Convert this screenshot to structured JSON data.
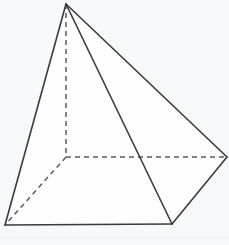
{
  "figure": {
    "name": "square-based-pyramid",
    "kind": "geometric-solid-line-drawing",
    "caption": "",
    "background_color": "#f7f8f9",
    "solid_edge_color": "#3a3a42",
    "hidden_edge_color": "#5a5a63",
    "face_fill_color": "#fdfdfd",
    "solid_stroke_width": 1.6,
    "hidden_stroke_width": 1.5,
    "hidden_dash_pattern": "5 4",
    "canvas": {
      "width": 229,
      "height": 245
    },
    "vertices": {
      "apex": {
        "label": "apex",
        "x": 66,
        "y": 4,
        "visible": true
      },
      "base_front_left": {
        "label": "base-front-left",
        "x": 5,
        "y": 225,
        "visible": true
      },
      "base_front_right": {
        "label": "base-front-right",
        "x": 172,
        "y": 224,
        "visible": true
      },
      "base_right": {
        "label": "base-right",
        "x": 227,
        "y": 157,
        "visible": true
      },
      "base_back_hidden": {
        "label": "base-back-hidden",
        "x": 66,
        "y": 157,
        "visible": false
      }
    },
    "edges": [
      {
        "name": "apex-to-front-left",
        "from": "apex",
        "to": "base_front_left",
        "style": "solid"
      },
      {
        "name": "apex-to-front-right",
        "from": "apex",
        "to": "base_front_right",
        "style": "solid"
      },
      {
        "name": "apex-to-right",
        "from": "apex",
        "to": "base_right",
        "style": "solid"
      },
      {
        "name": "apex-to-back-hidden",
        "from": "apex",
        "to": "base_back_hidden",
        "style": "dashed"
      },
      {
        "name": "base-front-left-to-front-right",
        "from": "base_front_left",
        "to": "base_front_right",
        "style": "solid"
      },
      {
        "name": "base-front-right-to-right",
        "from": "base_front_right",
        "to": "base_right",
        "style": "solid"
      },
      {
        "name": "base-right-to-back-hidden",
        "from": "base_right",
        "to": "base_back_hidden",
        "style": "dashed"
      },
      {
        "name": "base-back-hidden-to-front-left",
        "from": "base_back_hidden",
        "to": "base_front_left",
        "style": "dashed"
      }
    ],
    "paths": {
      "face_left": "M 66 4 L 5 225 L 172 224 Z",
      "face_right": "M 66 4 L 172 224 L 227 157 Z",
      "outline": "M 66 4 L 5 225 L 172 224 L 227 157 Z",
      "edge_apex_front_left": "M 66 4 L 5 225",
      "edge_apex_front_right": "M 66 4 L 172 224",
      "edge_apex_right": "M 66 4 L 227 157",
      "edge_base_front": "M 5 225 L 172 224",
      "edge_base_right_front": "M 172 224 L 227 157",
      "edge_apex_back_hidden": "M 66 4 L 66 157",
      "edge_back_to_right": "M 66 157 L 227 157",
      "edge_back_to_front_left": "M 66 157 L 5 225"
    }
  }
}
